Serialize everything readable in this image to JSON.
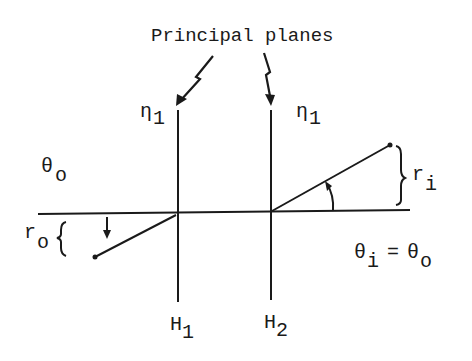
{
  "title": "Principal planes",
  "labels": {
    "plane1_index": "η",
    "plane1_index_sub": "1",
    "plane2_index": "η",
    "plane2_index_sub": "1",
    "theta_o": "θ",
    "theta_o_sub": "o",
    "r_o": "r",
    "r_o_sub": "o",
    "r_i": "r",
    "r_i_sub": "i",
    "theta_eq_lhs": "θ",
    "theta_eq_lhs_sub": "i",
    "theta_eq_op": "=",
    "theta_eq_rhs": "θ",
    "theta_eq_rhs_sub": "o",
    "H1": "H",
    "H1_sub": "1",
    "H2": "H",
    "H2_sub": "2"
  },
  "colors": {
    "ink": "#1a1a1a",
    "background": "#ffffff"
  }
}
